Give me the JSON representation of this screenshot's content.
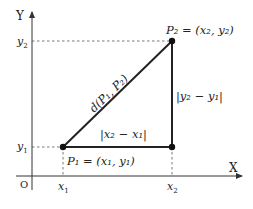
{
  "diagram": {
    "axes": {
      "x_label": "X",
      "y_label": "Y",
      "origin_label": "O"
    },
    "ticks": {
      "x1": "x",
      "x1_sub": "1",
      "x2": "x",
      "x2_sub": "2",
      "y1": "y",
      "y1_sub": "1",
      "y2": "y",
      "y2_sub": "2"
    },
    "points": {
      "p1_label": "P₁ = (x₁, y₁)",
      "p2_label": "P₂ = (x₂, y₂)"
    },
    "segments": {
      "hypotenuse_label": "d(P₁, P₂)",
      "horizontal_label": "|x₂ − x₁|",
      "vertical_label": "|y₂ − y₁|"
    },
    "colors": {
      "line": "#222222",
      "dashed": "#555555",
      "axis": "#333333"
    }
  }
}
